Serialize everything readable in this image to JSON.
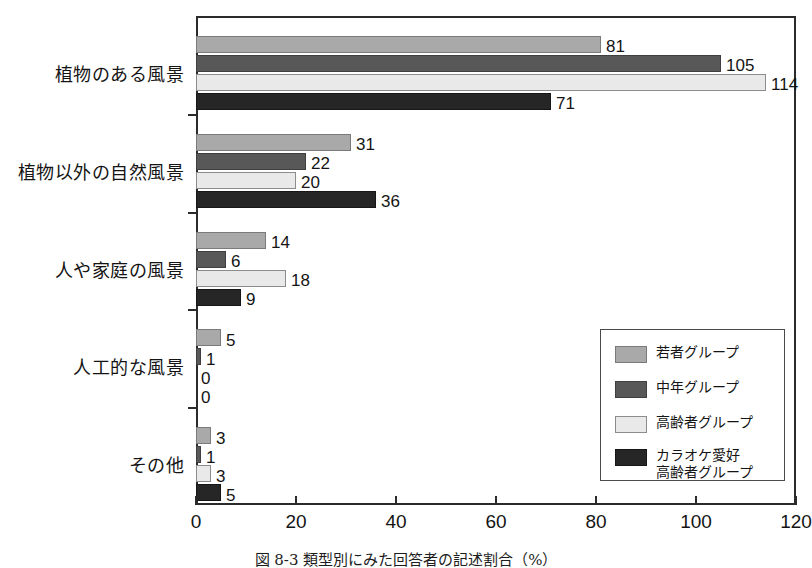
{
  "chart_data": {
    "type": "bar",
    "orientation": "horizontal",
    "title": "",
    "xlabel": "",
    "ylabel": "",
    "xlim": [
      0,
      120
    ],
    "xticks": [
      0,
      20,
      40,
      60,
      80,
      100,
      120
    ],
    "grid": false,
    "legend_position": "inner-right-lower",
    "categories": [
      "植物のある風景",
      "植物以外の自然風景",
      "人や家庭の風景",
      "人工的な風景",
      "その他"
    ],
    "series": [
      {
        "name": "若者グループ",
        "color": "#a9a9a9",
        "values": [
          81,
          31,
          14,
          5,
          3
        ]
      },
      {
        "name": "中年グループ",
        "color": "#585858",
        "values": [
          105,
          22,
          6,
          1,
          1
        ]
      },
      {
        "name": "高齢者グループ",
        "color": "#e9e9e9",
        "values": [
          114,
          20,
          18,
          0,
          3
        ]
      },
      {
        "name": "カラオケ愛好\n高齢者グループ",
        "color": "#262626",
        "values": [
          71,
          36,
          9,
          0,
          5
        ]
      }
    ]
  },
  "caption": {
    "text": "図 8-3  類型別にみた回答者の記述割合（%）"
  }
}
